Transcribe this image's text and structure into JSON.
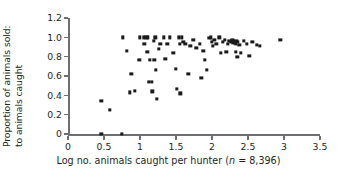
{
  "chart_data": {
    "type": "scatter",
    "title": "",
    "xlabel": "Log no. animals caught per hunter (n = 8,396)",
    "xlabel_prefix": "Log no. animals caught per hunter (",
    "xlabel_italic": "n",
    "xlabel_suffix": " = 8,396)",
    "ylabel_line1": "Proportion of animals sold:",
    "ylabel_line2": "to animals caught",
    "xlim": [
      0,
      3.5
    ],
    "ylim": [
      0,
      1.2
    ],
    "xticks": [
      0,
      0.5,
      1,
      1.5,
      2,
      2.5,
      3,
      3.5
    ],
    "xtick_labels": [
      "0",
      "0.5",
      "1",
      "1.5",
      "2",
      "2.5",
      "3",
      "3.5"
    ],
    "yticks": [
      0,
      0.2,
      0.4,
      0.6,
      0.8,
      1.0,
      1.2
    ],
    "ytick_labels": [
      "0",
      "0.2",
      "0.4",
      "0.6",
      "0.8",
      "1.0",
      "1.2"
    ],
    "grid": false,
    "legend": null,
    "marker": "square",
    "marker_color": "#1a1a1a",
    "axis_color": "#6d6e71",
    "points": [
      [
        0.46,
        0.34
      ],
      [
        0.46,
        0.0
      ],
      [
        0.58,
        0.25
      ],
      [
        0.75,
        0.0
      ],
      [
        0.76,
        1.0
      ],
      [
        0.82,
        0.86
      ],
      [
        0.86,
        0.43
      ],
      [
        0.88,
        0.62
      ],
      [
        0.93,
        0.45
      ],
      [
        0.99,
        0.77
      ],
      [
        1.0,
        1.0
      ],
      [
        1.05,
        1.0
      ],
      [
        1.06,
        0.93
      ],
      [
        1.09,
        1.0
      ],
      [
        1.1,
        0.85
      ],
      [
        1.11,
        1.0
      ],
      [
        1.12,
        0.54
      ],
      [
        1.14,
        0.77
      ],
      [
        1.16,
        0.54
      ],
      [
        1.17,
        0.44
      ],
      [
        1.19,
        0.96
      ],
      [
        1.2,
        0.77
      ],
      [
        1.21,
        1.0
      ],
      [
        1.22,
        0.66
      ],
      [
        1.23,
        0.36
      ],
      [
        1.26,
        0.88
      ],
      [
        1.28,
        0.93
      ],
      [
        1.33,
        1.0
      ],
      [
        1.35,
        0.78
      ],
      [
        1.38,
        0.93
      ],
      [
        1.41,
        1.0
      ],
      [
        1.46,
        0.84
      ],
      [
        1.5,
        0.67
      ],
      [
        1.51,
        0.47
      ],
      [
        1.54,
        1.0
      ],
      [
        1.55,
        0.93
      ],
      [
        1.56,
        0.42
      ],
      [
        1.58,
        1.0
      ],
      [
        1.6,
        0.95
      ],
      [
        1.63,
        0.93
      ],
      [
        1.67,
        0.62
      ],
      [
        1.7,
        0.91
      ],
      [
        1.74,
        0.97
      ],
      [
        1.78,
        0.89
      ],
      [
        1.83,
        0.93
      ],
      [
        1.85,
        0.58
      ],
      [
        1.88,
        0.86
      ],
      [
        1.9,
        0.77
      ],
      [
        1.93,
        0.66
      ],
      [
        1.96,
        0.99
      ],
      [
        1.98,
        1.0
      ],
      [
        2.0,
        0.95
      ],
      [
        2.01,
        0.91
      ],
      [
        2.03,
        0.97
      ],
      [
        2.06,
        0.93
      ],
      [
        2.1,
        1.0
      ],
      [
        2.12,
        0.84
      ],
      [
        2.15,
        0.95
      ],
      [
        2.18,
        0.97
      ],
      [
        2.2,
        0.85
      ],
      [
        2.22,
        0.93
      ],
      [
        2.24,
        0.96
      ],
      [
        2.26,
        0.95
      ],
      [
        2.28,
        0.97
      ],
      [
        2.29,
        0.94
      ],
      [
        2.3,
        0.96
      ],
      [
        2.31,
        0.95
      ],
      [
        2.32,
        0.94
      ],
      [
        2.33,
        0.93
      ],
      [
        2.33,
        0.85
      ],
      [
        2.34,
        0.96
      ],
      [
        2.35,
        0.8
      ],
      [
        2.36,
        0.95
      ],
      [
        2.38,
        0.92
      ],
      [
        2.4,
        0.84
      ],
      [
        2.44,
        0.96
      ],
      [
        2.48,
        0.93
      ],
      [
        2.52,
        0.81
      ],
      [
        2.56,
        0.95
      ],
      [
        2.62,
        0.92
      ],
      [
        2.66,
        0.91
      ],
      [
        2.95,
        0.97
      ]
    ]
  }
}
